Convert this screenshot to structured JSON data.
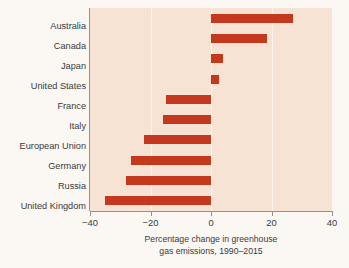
{
  "chart_data": {
    "type": "bar",
    "orientation": "horizontal",
    "title": "",
    "xlabel": "Percentage change in greenhouse gas emissions, 1990–2015",
    "xlabel_line1": "Percentage change in greenhouse",
    "xlabel_line2": "gas emissions, 1990–2015",
    "ylabel": "",
    "categories": [
      "Australia",
      "Canada",
      "Japan",
      "United States",
      "France",
      "Italy",
      "European Union",
      "Germany",
      "Russia",
      "United Kingdom"
    ],
    "values": [
      27,
      18.5,
      4,
      2.5,
      -15,
      -16,
      -22,
      -26.5,
      -28,
      -35
    ],
    "xlim": [
      -40,
      40
    ],
    "xticks": [
      -40,
      -20,
      0,
      20,
      40
    ],
    "xticklabels": [
      "−40",
      "−20",
      "0",
      "20",
      "40"
    ],
    "grid": true,
    "gridlines_at": [
      -20,
      0,
      20
    ],
    "legend": "none",
    "bar_color": "#c4391e",
    "plot_background": "#f6e3d4",
    "gridline_color": "#fdf6f0",
    "axis_color": "#9c8d86",
    "figure_background": "#fbf8f4"
  }
}
